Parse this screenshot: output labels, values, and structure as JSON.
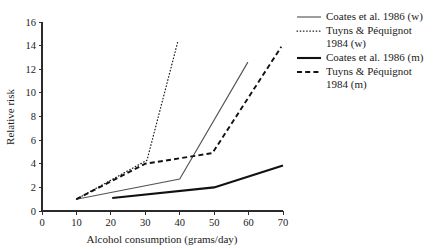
{
  "chart_data": {
    "type": "line",
    "title": "",
    "xlabel": "Alcohol consumption (grams/day)",
    "ylabel": "Relative risk",
    "xlim": [
      0,
      70
    ],
    "ylim": [
      0,
      16
    ],
    "xticks": [
      0,
      10,
      20,
      30,
      40,
      50,
      60,
      70
    ],
    "yticks": [
      0,
      2,
      4,
      6,
      8,
      10,
      12,
      14,
      16
    ],
    "grid": false,
    "legend_position": "right",
    "series": [
      {
        "name": "Coates et al. 1986 (w)",
        "style": "solid-thin",
        "color": "#555555",
        "x": [
          10,
          40,
          59.8
        ],
        "y": [
          1.0,
          2.7,
          12.6
        ]
      },
      {
        "name": "Tuyns & Péquignot 1984 (w)",
        "style": "dotted",
        "color": "#1a1a1a",
        "x": [
          10,
          30.5,
          39.5
        ],
        "y": [
          1.0,
          4.3,
          14.4
        ]
      },
      {
        "name": "Coates et al. 1986 (m)",
        "style": "solid-thick",
        "color": "#111111",
        "x": [
          20.4,
          50,
          70
        ],
        "y": [
          1.1,
          2.0,
          3.85
        ]
      },
      {
        "name": "Tuyns & Péquignot 1984 (m)",
        "style": "dashed",
        "color": "#111111",
        "x": [
          10,
          30,
          49.5,
          69.5
        ],
        "y": [
          1.0,
          4.0,
          4.9,
          13.9
        ]
      }
    ]
  },
  "axes": {
    "x_label": "Alcohol consumption (grams/day)",
    "y_label": "Relative risk",
    "x_tick_labels": [
      "0",
      "10",
      "20",
      "30",
      "40",
      "50",
      "60",
      "70"
    ],
    "y_tick_labels": [
      "0",
      "2",
      "4",
      "6",
      "8",
      "10",
      "12",
      "14",
      "16"
    ]
  },
  "legend": {
    "entries": [
      {
        "label": "Coates et al. 1986 (w)",
        "style": "solid-thin"
      },
      {
        "label": "Tuyns & Péquignot\n1984 (w)",
        "style": "dotted"
      },
      {
        "label": "Coates et al. 1986 (m)",
        "style": "solid-thick"
      },
      {
        "label": "Tuyns & Péquignot\n1984 (m)",
        "style": "dashed"
      }
    ]
  }
}
